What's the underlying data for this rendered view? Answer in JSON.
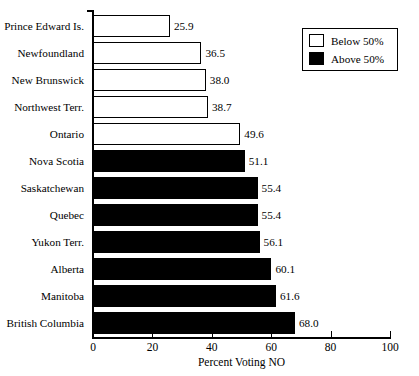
{
  "chart_data": {
    "type": "bar",
    "orientation": "horizontal",
    "title": "",
    "xlabel": "Percent Voting NO",
    "ylabel": "",
    "xlim": [
      0,
      100
    ],
    "xticks": [
      0,
      20,
      40,
      60,
      80,
      100
    ],
    "grid": false,
    "categories": [
      "Prince Edward Is.",
      "Newfoundland",
      "New Brunswick",
      "Northwest Terr.",
      "Ontario",
      "Nova Scotia",
      "Saskatchewan",
      "Quebec",
      "Yukon Terr.",
      "Alberta",
      "Manitoba",
      "British Columbia"
    ],
    "values": [
      25.9,
      36.5,
      38.0,
      38.7,
      49.6,
      51.1,
      55.4,
      55.4,
      56.1,
      60.1,
      61.6,
      68.0
    ],
    "value_labels": [
      "25.9",
      "36.5",
      "38.0",
      "38.7",
      "49.6",
      "51.1",
      "55.4",
      "55.4",
      "56.1",
      "60.1",
      "61.6",
      "68.0"
    ],
    "groups": [
      "below",
      "below",
      "below",
      "below",
      "below",
      "above",
      "above",
      "above",
      "above",
      "above",
      "above",
      "above"
    ],
    "legend": {
      "position": "top-right",
      "entries": [
        {
          "label": "Below 50%",
          "fill": "#ffffff",
          "edge": "#000000"
        },
        {
          "label": "Above 50%",
          "fill": "#000000",
          "edge": "#000000"
        }
      ]
    },
    "colors": {
      "below_fill": "#ffffff",
      "above_fill": "#000000",
      "edge": "#000000",
      "background": "#ffffff",
      "text": "#000000"
    }
  }
}
